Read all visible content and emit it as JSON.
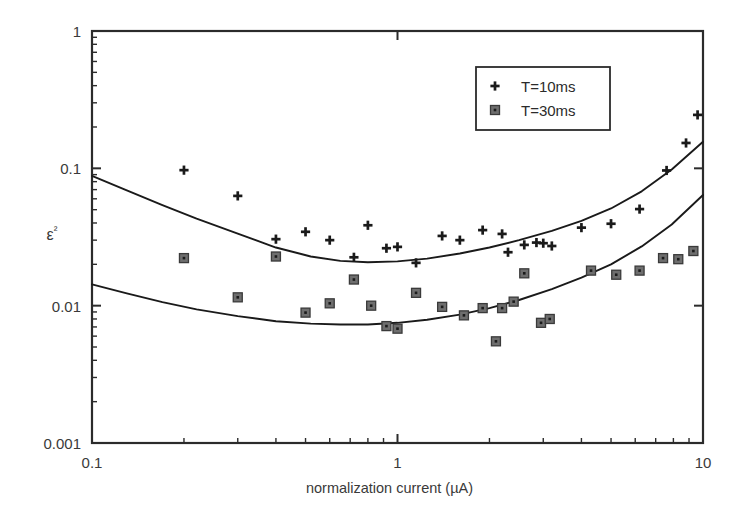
{
  "chart_data": {
    "type": "scatter",
    "title": "",
    "xlabel": "normalization current (µA)",
    "ylabel": "ε²",
    "xscale": "log",
    "yscale": "log",
    "xlim": [
      0.1,
      10
    ],
    "ylim": [
      0.001,
      1
    ],
    "xticks": [
      0.1,
      1,
      10
    ],
    "xtick_labels": [
      "0.1",
      "1",
      "10"
    ],
    "yticks": [
      0.001,
      0.01,
      0.1,
      1
    ],
    "ytick_labels": [
      "0.001",
      "0.01",
      "0.1",
      "1"
    ],
    "grid": false,
    "minor_ticks": true,
    "legend_position": "top-right",
    "series": [
      {
        "name": "T=10ms",
        "marker": "plus",
        "color": "#1a1a1a",
        "points": [
          [
            0.2,
            0.097
          ],
          [
            0.3,
            0.063
          ],
          [
            0.4,
            0.0305
          ],
          [
            0.5,
            0.0345
          ],
          [
            0.6,
            0.03
          ],
          [
            0.72,
            0.0225
          ],
          [
            0.8,
            0.0385
          ],
          [
            0.92,
            0.0262
          ],
          [
            1.0,
            0.0268
          ],
          [
            1.15,
            0.0205
          ],
          [
            1.4,
            0.0322
          ],
          [
            1.6,
            0.03
          ],
          [
            1.9,
            0.0355
          ],
          [
            2.2,
            0.0333
          ],
          [
            2.3,
            0.0245
          ],
          [
            2.6,
            0.0277
          ],
          [
            2.85,
            0.0288
          ],
          [
            3.0,
            0.0285
          ],
          [
            3.2,
            0.0272
          ],
          [
            4.0,
            0.037
          ],
          [
            5.0,
            0.0395
          ],
          [
            6.2,
            0.0505
          ],
          [
            7.6,
            0.0965
          ],
          [
            8.8,
            0.153
          ],
          [
            9.6,
            0.245
          ]
        ]
      },
      {
        "name": "T=30ms",
        "marker": "square",
        "color": "#6e6e6e",
        "points": [
          [
            0.2,
            0.0222
          ],
          [
            0.3,
            0.0115
          ],
          [
            0.4,
            0.0228
          ],
          [
            0.5,
            0.0089
          ],
          [
            0.6,
            0.0104
          ],
          [
            0.72,
            0.0155
          ],
          [
            0.82,
            0.01
          ],
          [
            0.92,
            0.0071
          ],
          [
            1.0,
            0.0068
          ],
          [
            1.15,
            0.0124
          ],
          [
            1.4,
            0.0098
          ],
          [
            1.65,
            0.0085
          ],
          [
            1.9,
            0.0096
          ],
          [
            2.1,
            0.0055
          ],
          [
            2.2,
            0.0096
          ],
          [
            2.4,
            0.0107
          ],
          [
            2.6,
            0.0172
          ],
          [
            2.95,
            0.0075
          ],
          [
            3.15,
            0.008
          ],
          [
            4.3,
            0.018
          ],
          [
            5.2,
            0.0168
          ],
          [
            6.2,
            0.018
          ],
          [
            7.4,
            0.0222
          ],
          [
            8.3,
            0.0218
          ],
          [
            9.3,
            0.025
          ]
        ]
      }
    ],
    "fit_curves": [
      {
        "name": "fit-T10",
        "for_series": "T=10ms",
        "points": [
          [
            0.1,
            0.088
          ],
          [
            0.13,
            0.069
          ],
          [
            0.17,
            0.054
          ],
          [
            0.22,
            0.043
          ],
          [
            0.3,
            0.0335
          ],
          [
            0.4,
            0.0265
          ],
          [
            0.52,
            0.0228
          ],
          [
            0.65,
            0.0212
          ],
          [
            0.8,
            0.0207
          ],
          [
            1.0,
            0.021
          ],
          [
            1.25,
            0.022
          ],
          [
            1.6,
            0.024
          ],
          [
            2.0,
            0.0265
          ],
          [
            2.5,
            0.03
          ],
          [
            3.2,
            0.035
          ],
          [
            4.0,
            0.0415
          ],
          [
            5.0,
            0.051
          ],
          [
            6.3,
            0.068
          ],
          [
            7.9,
            0.098
          ],
          [
            10.0,
            0.156
          ]
        ]
      },
      {
        "name": "fit-T30",
        "for_series": "T=30ms",
        "points": [
          [
            0.1,
            0.0143
          ],
          [
            0.13,
            0.0123
          ],
          [
            0.17,
            0.0106
          ],
          [
            0.22,
            0.0094
          ],
          [
            0.3,
            0.0084
          ],
          [
            0.4,
            0.0077
          ],
          [
            0.52,
            0.0074
          ],
          [
            0.65,
            0.0073
          ],
          [
            0.8,
            0.0073
          ],
          [
            1.0,
            0.0075
          ],
          [
            1.25,
            0.0079
          ],
          [
            1.6,
            0.0086
          ],
          [
            2.0,
            0.0096
          ],
          [
            2.5,
            0.011
          ],
          [
            3.2,
            0.0132
          ],
          [
            4.0,
            0.016
          ],
          [
            5.0,
            0.02
          ],
          [
            6.3,
            0.027
          ],
          [
            7.9,
            0.039
          ],
          [
            10.0,
            0.064
          ]
        ]
      }
    ],
    "legend": [
      {
        "label": "T=10ms",
        "marker": "plus",
        "color": "#1a1a1a"
      },
      {
        "label": "T=30ms",
        "marker": "square",
        "color": "#6e6e6e"
      }
    ]
  },
  "axes": {
    "frame_color": "#2b2b2b"
  }
}
